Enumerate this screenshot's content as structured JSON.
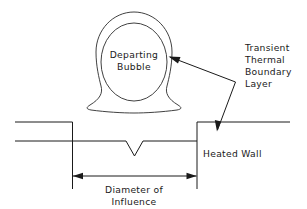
{
  "figure": {
    "background_color": "#ffffff",
    "line_color": "#1a1a1a"
  },
  "labels": {
    "bubble_line1": "Departing",
    "bubble_line2": "Bubble",
    "boundary_layer_line1": "Transient",
    "boundary_layer_line2": "Thermal",
    "boundary_layer_line3": "Boundary",
    "boundary_layer_line4": "Layer",
    "heated_wall": "Heated  Wall",
    "dimension_line1": "Diameter  of",
    "dimension_line2": "Influence"
  },
  "icons": {
    "bubble": "departing-bubble-shape",
    "notch": "nucleation-site-cavity",
    "leader": "leader-line-with-arrowheads",
    "dimension": "double-headed-dimension-arrow"
  }
}
